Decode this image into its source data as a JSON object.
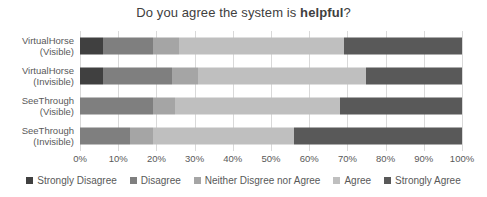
{
  "title": {
    "prefix": "Do you agree the system is ",
    "bold": "helpful",
    "suffix": "?"
  },
  "chart_data": {
    "type": "bar",
    "orientation": "horizontal-stacked",
    "title": "Do you agree the system is helpful?",
    "xlabel": "",
    "ylabel": "",
    "xlim": [
      0,
      100
    ],
    "grid": true,
    "gridline_color": "#d9d9d9",
    "text_color": "#595959",
    "legend_position": "bottom",
    "categories": [
      {
        "line1": "VirtualHorse",
        "line2": "(Visible)"
      },
      {
        "line1": "VirtualHorse",
        "line2": "(Invisible)"
      },
      {
        "line1": "SeeThrough",
        "line2": "(Visible)"
      },
      {
        "line1": "SeeThrough",
        "line2": "(Invisible)"
      }
    ],
    "x_ticks": [
      "0%",
      "10%",
      "20%",
      "30%",
      "40%",
      "50%",
      "60%",
      "70%",
      "80%",
      "90%",
      "100%"
    ],
    "series": [
      {
        "name": "Strongly Disagree",
        "color": "#404040",
        "values": [
          6,
          6,
          0,
          0
        ]
      },
      {
        "name": "Disagree",
        "color": "#7f7f7f",
        "values": [
          13,
          18,
          19,
          13
        ]
      },
      {
        "name": "Neither Disgree nor Agree",
        "color": "#a5a5a5",
        "values": [
          7,
          7,
          6,
          6
        ]
      },
      {
        "name": "Agree",
        "color": "#bfbfbf",
        "values": [
          43,
          44,
          43,
          37
        ]
      },
      {
        "name": "Strongly Agree",
        "color": "#595959",
        "values": [
          31,
          25,
          32,
          44
        ]
      }
    ]
  }
}
